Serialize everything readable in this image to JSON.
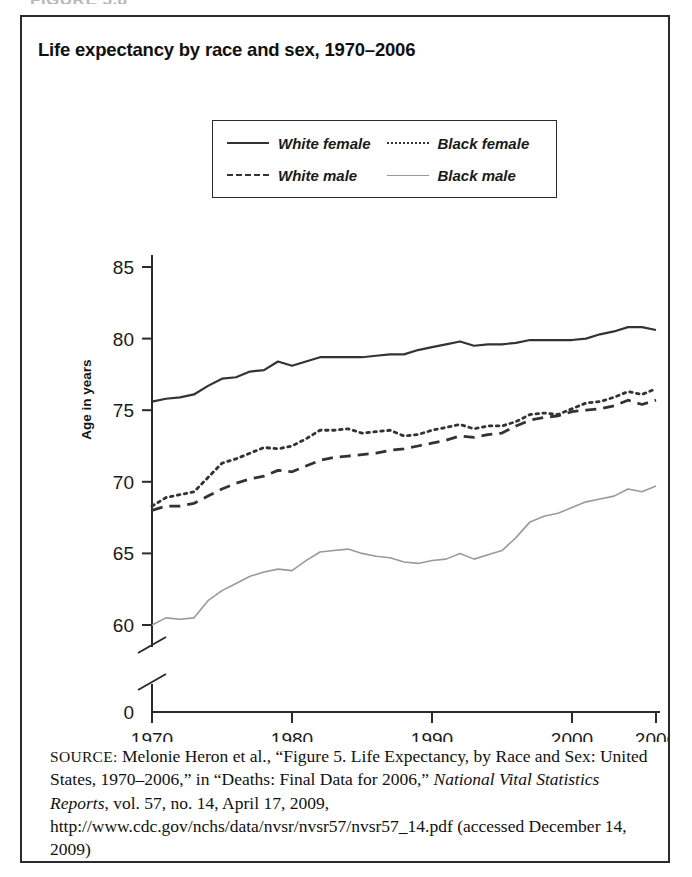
{
  "figure_header": "FIGURE 5.8",
  "figure": {
    "title": "Life expectancy by race and sex, 1970–2006"
  },
  "legend": {
    "items": [
      {
        "label": "White female",
        "style": "solid",
        "swatch": "legend-line-solid"
      },
      {
        "label": "Black female",
        "style": "dotted",
        "swatch": "legend-line-dotted"
      },
      {
        "label": "White male",
        "style": "dashed",
        "swatch": "legend-line-dashed"
      },
      {
        "label": "Black male",
        "style": "light",
        "swatch": "legend-line-light"
      }
    ]
  },
  "axes": {
    "y_title": "Age in years",
    "y_ticks": [
      "85",
      "80",
      "75",
      "70",
      "65",
      "60",
      "0"
    ],
    "x_ticks": [
      "1970",
      "1980",
      "1990",
      "2000",
      "2006"
    ],
    "axis_break": true
  },
  "source": {
    "label": "SOURCE:",
    "text": " Melonie Heron et al., “Figure 5. Life Expectancy, by Race and Sex: United States, 1970–2006,” in “Deaths: Final Data for 2006,” ",
    "italic_part": "National Vital Statistics Reports",
    "text_tail": ", vol. 57, no. 14, April 17, 2009, http://www.cdc.gov/nchs/data/nvsr/nvsr57/nvsr57_14.pdf (accessed December 14, 2009)"
  },
  "colors": {
    "ink": "#2b2b2b",
    "white_female": "#333333",
    "white_male": "#333333",
    "black_female": "#333333",
    "black_male": "#9a9a9a",
    "frame": "#2b2b2b",
    "background": "#ffffff"
  },
  "chart_data": {
    "type": "line",
    "title": "Life expectancy by race and sex, 1970–2006",
    "xlabel": "",
    "ylabel": "Age in years",
    "xlim": [
      1970,
      2006
    ],
    "ylim": [
      58.5,
      85
    ],
    "y_ticks": [
      60,
      65,
      70,
      75,
      80,
      85
    ],
    "x_ticks": [
      1970,
      1980,
      1990,
      2000,
      2006
    ],
    "grid": false,
    "legend_position": "above-plot",
    "axis_break_note": "y-axis broken between 0 and ~58.5",
    "x": [
      1970,
      1971,
      1972,
      1973,
      1974,
      1975,
      1976,
      1977,
      1978,
      1979,
      1980,
      1981,
      1982,
      1983,
      1984,
      1985,
      1986,
      1987,
      1988,
      1989,
      1990,
      1991,
      1992,
      1993,
      1994,
      1995,
      1996,
      1997,
      1998,
      1999,
      2000,
      2001,
      2002,
      2003,
      2004,
      2005,
      2006
    ],
    "series": [
      {
        "name": "White female",
        "style": "solid",
        "color": "#333333",
        "values": [
          75.6,
          75.8,
          75.9,
          76.1,
          76.7,
          77.2,
          77.3,
          77.7,
          77.8,
          78.4,
          78.1,
          78.4,
          78.7,
          78.7,
          78.7,
          78.7,
          78.8,
          78.9,
          78.9,
          79.2,
          79.4,
          79.6,
          79.8,
          79.5,
          79.6,
          79.6,
          79.7,
          79.9,
          79.9,
          79.9,
          79.9,
          80.0,
          80.3,
          80.5,
          80.8,
          80.8,
          80.6
        ]
      },
      {
        "name": "Black female",
        "style": "dotted",
        "color": "#333333",
        "values": [
          68.3,
          68.9,
          69.1,
          69.3,
          70.3,
          71.3,
          71.6,
          72.0,
          72.4,
          72.3,
          72.5,
          73.0,
          73.6,
          73.6,
          73.7,
          73.4,
          73.5,
          73.6,
          73.2,
          73.3,
          73.6,
          73.8,
          74.0,
          73.7,
          73.9,
          73.9,
          74.2,
          74.7,
          74.8,
          74.7,
          75.1,
          75.5,
          75.6,
          75.9,
          76.3,
          76.1,
          76.5
        ]
      },
      {
        "name": "White male",
        "style": "dashed",
        "color": "#333333",
        "values": [
          68.0,
          68.3,
          68.3,
          68.5,
          69.0,
          69.5,
          69.9,
          70.2,
          70.4,
          70.8,
          70.7,
          71.1,
          71.5,
          71.7,
          71.8,
          71.9,
          72.0,
          72.2,
          72.3,
          72.5,
          72.7,
          72.9,
          73.2,
          73.1,
          73.3,
          73.4,
          73.9,
          74.3,
          74.5,
          74.6,
          74.9,
          75.0,
          75.1,
          75.3,
          75.7,
          75.4,
          75.7
        ]
      },
      {
        "name": "Black male",
        "style": "light",
        "color": "#9a9a9a",
        "values": [
          60.0,
          60.5,
          60.4,
          60.5,
          61.7,
          62.4,
          62.9,
          63.4,
          63.7,
          63.9,
          63.8,
          64.5,
          65.1,
          65.2,
          65.3,
          65.0,
          64.8,
          64.7,
          64.4,
          64.3,
          64.5,
          64.6,
          65.0,
          64.6,
          64.9,
          65.2,
          66.1,
          67.2,
          67.6,
          67.8,
          68.2,
          68.6,
          68.8,
          69.0,
          69.5,
          69.3,
          69.7
        ]
      }
    ]
  }
}
